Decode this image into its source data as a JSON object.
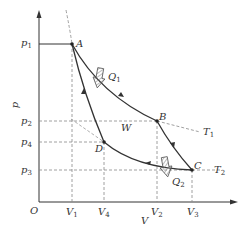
{
  "diagram": {
    "type": "p-V cycle diagram",
    "axes": {
      "x_label": "V",
      "y_label": "p",
      "origin_label": "O",
      "x_ticks": [
        {
          "base": "V",
          "sub": "1"
        },
        {
          "base": "V",
          "sub": "4"
        },
        {
          "base": "V",
          "sub": "2"
        },
        {
          "base": "V",
          "sub": "3"
        }
      ],
      "y_ticks": [
        {
          "base": "p",
          "sub": "1"
        },
        {
          "base": "p",
          "sub": "2"
        },
        {
          "base": "p",
          "sub": "4"
        },
        {
          "base": "p",
          "sub": "3"
        }
      ]
    },
    "points": {
      "A": "A",
      "B": "B",
      "C": "C",
      "D": "D"
    },
    "labels": {
      "work": "W",
      "heat_in": {
        "base": "Q",
        "sub": "1"
      },
      "heat_out": {
        "base": "Q",
        "sub": "2"
      },
      "isotherm_hot": {
        "base": "T",
        "sub": "1"
      },
      "isotherm_cold": {
        "base": "T",
        "sub": "2"
      }
    },
    "process_path": [
      "A",
      "B",
      "C",
      "D",
      "A"
    ],
    "colors": {
      "line": "#333333",
      "dashed": "#888888",
      "hatch": "#777777"
    }
  }
}
